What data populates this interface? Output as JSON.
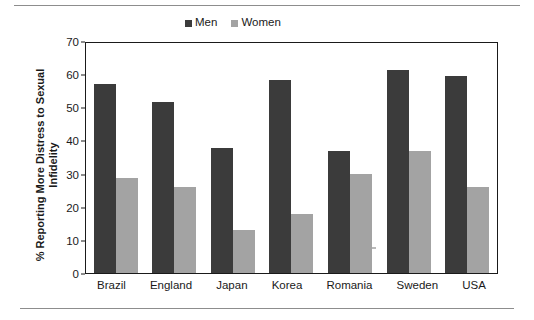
{
  "chart_data": {
    "type": "bar",
    "title": "",
    "xlabel": "",
    "ylabel": "% Reporting More Distress to Sexual Infidelity",
    "ylabel_lines": [
      "% Reporting More Distress to Sexual",
      "Infidelity"
    ],
    "ylim": [
      0,
      70
    ],
    "yticks": [
      0,
      10,
      20,
      30,
      40,
      50,
      60,
      70
    ],
    "grid": false,
    "legend_position": "top-center",
    "categories": [
      "Brazil",
      "England",
      "Japan",
      "Korea",
      "Romania",
      "Sweden",
      "USA"
    ],
    "series": [
      {
        "name": "Men",
        "color": "#3b3b3b",
        "values": [
          57.5,
          52,
          38,
          59,
          37,
          62,
          60
        ]
      },
      {
        "name": "Women",
        "color": "#a3a3a3",
        "values": [
          29,
          26,
          13,
          18,
          30,
          37,
          26
        ]
      }
    ]
  },
  "legend": {
    "items": [
      {
        "label": "Men"
      },
      {
        "label": "Women"
      }
    ]
  },
  "axes": {
    "y_title_line1": "% Reporting More Distress to Sexual",
    "y_title_line2": "Infidelity",
    "y_ticks": [
      "70",
      "60",
      "50",
      "40",
      "30",
      "20",
      "10",
      "0"
    ]
  }
}
